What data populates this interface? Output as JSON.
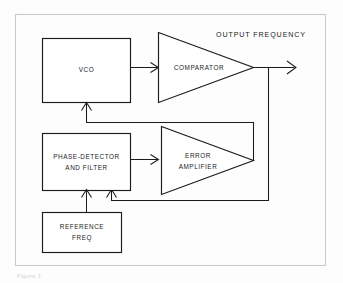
{
  "figure": {
    "type": "block-diagram",
    "caption": "Figure 1",
    "frame_color": "#c9c9c9",
    "line_color": "#1b1b1b",
    "background_color": "#fdfdfd"
  },
  "blocks": {
    "vco": {
      "label": "VCO",
      "shape": "rectangle"
    },
    "comparator": {
      "label": "COMPARATOR",
      "shape": "triangle"
    },
    "phase_detector": {
      "label_line1": "PHASE-DETECTOR",
      "label_line2": "AND FILTER",
      "shape": "rectangle"
    },
    "error_amplifier": {
      "label_line1": "ERROR",
      "label_line2": "AMPLIFIER",
      "shape": "triangle"
    },
    "reference_freq": {
      "label_line1": "REFERENCE",
      "label_line2": "FREQ",
      "shape": "rectangle"
    }
  },
  "annotations": {
    "output_frequency": "OUTPUT FREQUENCY"
  },
  "signals": [
    {
      "name": "vco-to-comparator",
      "from": "vco",
      "to": "comparator"
    },
    {
      "name": "comparator-output",
      "from": "comparator",
      "to": "output-frequency"
    },
    {
      "name": "output-feedback-to-phase-detector",
      "from": "comparator-output",
      "to": "phase_detector"
    },
    {
      "name": "phase-detector-to-error-amplifier",
      "from": "phase_detector",
      "to": "error_amplifier"
    },
    {
      "name": "error-amplifier-to-vco",
      "from": "error_amplifier",
      "to": "vco"
    },
    {
      "name": "reference-to-phase-detector",
      "from": "reference_freq",
      "to": "phase_detector"
    }
  ]
}
